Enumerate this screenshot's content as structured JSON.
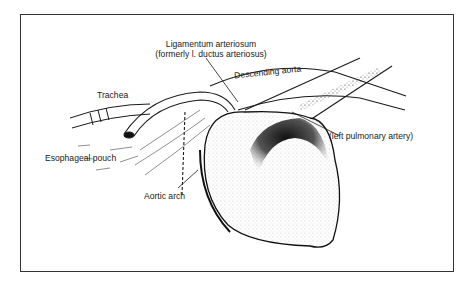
{
  "figure": {
    "type": "anatomical-illustration",
    "border_color": "#333333",
    "ink_color": "#1a1a1a"
  },
  "labels": {
    "ligamentum_line1": "Ligamentum arteriosum",
    "ligamentum_line2": "(formerly l. ductus arteriosus)",
    "descending_aorta": "Descending aorta",
    "trachea": "Trachea",
    "left_pulmonary_artery": "(left pulmonary artery)",
    "esophageal_pouch": "Esophageal pouch",
    "aortic_arch": "Aortic arch"
  }
}
